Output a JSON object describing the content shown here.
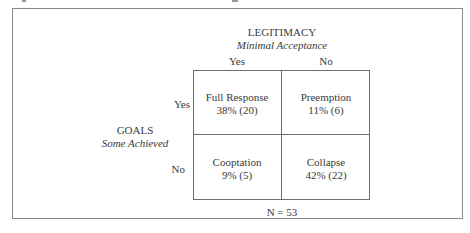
{
  "figure": {
    "column_header": {
      "title": "LEGITIMACY",
      "subtitle": "Minimal Acceptance",
      "levels": [
        "Yes",
        "No"
      ]
    },
    "row_header": {
      "title": "GOALS",
      "subtitle": "Some Achieved",
      "levels": [
        "Yes",
        "No"
      ]
    },
    "cells": [
      {
        "label": "Full Response",
        "value": "38% (20)"
      },
      {
        "label": "Preemption",
        "value": "11% (6)"
      },
      {
        "label": "Cooptation",
        "value": "9% (5)"
      },
      {
        "label": "Collapse",
        "value": "42% (22)"
      }
    ],
    "footer": "N = 53"
  }
}
